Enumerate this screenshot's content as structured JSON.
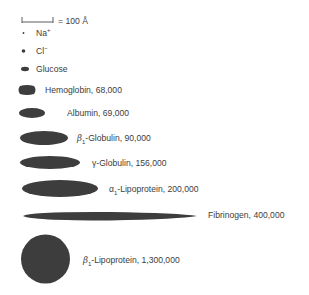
{
  "scale_bar": {
    "label": "= 100 Å"
  },
  "legend": [
    {
      "symbol": "dot-small",
      "label": "Na",
      "superscript": "+"
    },
    {
      "symbol": "dot-medium",
      "label": "Cl",
      "superscript": "−"
    },
    {
      "symbol": "ellipse-small",
      "label": "Glucose"
    }
  ],
  "molecules": [
    {
      "name": "Hemoglobin",
      "prefix": "",
      "subscript": "",
      "weight": "68,000",
      "label": "Hemoglobin, 68,000"
    },
    {
      "name": "Albumin",
      "prefix": "",
      "subscript": "",
      "weight": "69,000",
      "label": "Albumin, 69,000"
    },
    {
      "name": "Globulin",
      "prefix": "β",
      "subscript": "1",
      "weight": "90,000",
      "label": "-Globulin, 90,000"
    },
    {
      "name": "Globulin",
      "prefix": "γ",
      "subscript": "",
      "weight": "156,000",
      "label": "-Globulin, 156,000"
    },
    {
      "name": "Lipoprotein",
      "prefix": "α",
      "subscript": "1",
      "weight": "200,000",
      "label": "-Lipoprotein, 200,000"
    },
    {
      "name": "Fibrinogen",
      "prefix": "",
      "subscript": "",
      "weight": "400,000",
      "label": "Fibrinogen, 400,000"
    },
    {
      "name": "Lipoprotein",
      "prefix": "β",
      "subscript": "1",
      "weight": "1,300,000",
      "label": "-Lipoprotein, 1,300,000"
    }
  ],
  "colors": {
    "shape_fill": "#3d3d3d",
    "text": "#3c3c3c",
    "background": "#ffffff"
  }
}
